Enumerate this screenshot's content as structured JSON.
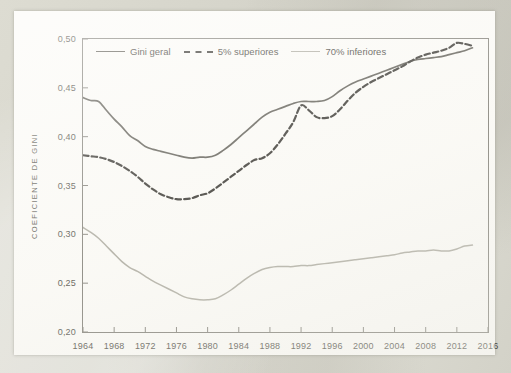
{
  "figure": {
    "background_color": "#d8d7cd",
    "page_color": "#fbfaf6",
    "frame_color": "#7c7a72"
  },
  "legend": {
    "position": "top-left inside plot",
    "items": [
      {
        "label": "Gini geral",
        "style": "solid",
        "color": "#55534b",
        "name": "legend-item-gini-geral"
      },
      {
        "label": "5% superiores",
        "style": "dashed",
        "color": "#2c2a25",
        "name": "legend-item-5-superiores"
      },
      {
        "label": "70% inferiores",
        "style": "solid",
        "color": "#a9a79c",
        "name": "legend-item-70-inferiores"
      }
    ]
  },
  "axes": {
    "y_title": "COEFICIENTE DE GINI",
    "y_ticks": [
      "0,20",
      "0,25",
      "0,30",
      "0,35",
      "0,40",
      "0,45",
      "0,50"
    ],
    "x_ticks": [
      "1964",
      "1968",
      "1972",
      "1976",
      "1980",
      "1984",
      "1988",
      "1992",
      "1996",
      "2000",
      "2004",
      "2008",
      "2012",
      "2016"
    ]
  },
  "chart_data": {
    "type": "line",
    "title": "",
    "xlabel": "",
    "ylabel": "COEFICIENTE DE GINI",
    "xlim": [
      1964,
      2016
    ],
    "ylim": [
      0.2,
      0.5
    ],
    "ytick_values": [
      0.2,
      0.25,
      0.3,
      0.35,
      0.4,
      0.45,
      0.5
    ],
    "ytick_labels": [
      "0,20",
      "0,25",
      "0,30",
      "0,35",
      "0,40",
      "0,45",
      "0,50"
    ],
    "xtick_values": [
      1964,
      1968,
      1972,
      1976,
      1980,
      1984,
      1988,
      1992,
      1996,
      2000,
      2004,
      2008,
      2012,
      2016
    ],
    "xtick_labels": [
      "1964",
      "1968",
      "1972",
      "1976",
      "1980",
      "1984",
      "1988",
      "1992",
      "1996",
      "2000",
      "2004",
      "2008",
      "2012",
      "2016"
    ],
    "grid": false,
    "legend_position": "upper left",
    "x": [
      1964,
      1965,
      1966,
      1967,
      1968,
      1969,
      1970,
      1971,
      1972,
      1973,
      1974,
      1975,
      1976,
      1977,
      1978,
      1979,
      1980,
      1981,
      1982,
      1983,
      1984,
      1985,
      1986,
      1987,
      1988,
      1989,
      1990,
      1991,
      1992,
      1993,
      1994,
      1995,
      1996,
      1997,
      1998,
      1999,
      2000,
      2001,
      2002,
      2003,
      2004,
      2005,
      2006,
      2007,
      2008,
      2009,
      2010,
      2011,
      2012,
      2013,
      2014
    ],
    "series": [
      {
        "name": "Gini geral",
        "style": "solid",
        "color": "#55534b",
        "values": [
          0.44,
          0.437,
          0.436,
          0.427,
          0.418,
          0.41,
          0.401,
          0.396,
          0.39,
          0.387,
          0.385,
          0.383,
          0.381,
          0.379,
          0.378,
          0.379,
          0.379,
          0.381,
          0.386,
          0.392,
          0.399,
          0.406,
          0.413,
          0.42,
          0.425,
          0.428,
          0.431,
          0.434,
          0.436,
          0.436,
          0.436,
          0.437,
          0.441,
          0.447,
          0.452,
          0.456,
          0.459,
          0.462,
          0.465,
          0.468,
          0.471,
          0.474,
          0.477,
          0.479,
          0.48,
          0.481,
          0.482,
          0.484,
          0.486,
          0.488,
          0.491
        ]
      },
      {
        "name": "5% superiores",
        "style": "dashed",
        "color": "#2c2a25",
        "values": [
          0.381,
          0.38,
          0.379,
          0.377,
          0.374,
          0.37,
          0.365,
          0.359,
          0.352,
          0.346,
          0.341,
          0.338,
          0.336,
          0.336,
          0.337,
          0.34,
          0.342,
          0.347,
          0.353,
          0.359,
          0.365,
          0.371,
          0.376,
          0.378,
          0.383,
          0.392,
          0.403,
          0.415,
          0.432,
          0.427,
          0.42,
          0.419,
          0.421,
          0.428,
          0.437,
          0.445,
          0.451,
          0.456,
          0.46,
          0.464,
          0.468,
          0.472,
          0.477,
          0.481,
          0.484,
          0.486,
          0.488,
          0.491,
          0.496,
          0.495,
          0.493
        ]
      },
      {
        "name": "70% inferiores",
        "style": "solid",
        "color": "#a9a79c",
        "values": [
          0.307,
          0.302,
          0.296,
          0.288,
          0.28,
          0.272,
          0.266,
          0.262,
          0.257,
          0.252,
          0.248,
          0.244,
          0.24,
          0.236,
          0.234,
          0.233,
          0.233,
          0.234,
          0.238,
          0.243,
          0.249,
          0.255,
          0.26,
          0.264,
          0.266,
          0.267,
          0.267,
          0.267,
          0.268,
          0.268,
          0.269,
          0.27,
          0.271,
          0.272,
          0.273,
          0.274,
          0.275,
          0.276,
          0.277,
          0.278,
          0.279,
          0.281,
          0.282,
          0.283,
          0.283,
          0.284,
          0.283,
          0.283,
          0.285,
          0.288,
          0.289
        ]
      }
    ]
  }
}
